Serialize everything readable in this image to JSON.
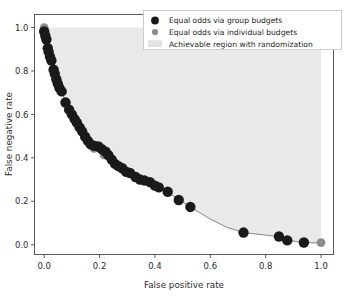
{
  "chart_data": {
    "type": "scatter",
    "title": "",
    "xlabel": "False positive rate",
    "ylabel": "False negative rate",
    "xlim": [
      -0.035,
      1.045
    ],
    "ylim": [
      -0.045,
      1.06
    ],
    "xticks": [
      0.0,
      0.2,
      0.4,
      0.6,
      0.8,
      1.0
    ],
    "yticks": [
      0.0,
      0.2,
      0.4,
      0.6,
      0.8,
      1.0
    ],
    "xticklabels": [
      "0.0",
      "0.2",
      "0.4",
      "0.6",
      "0.8",
      "1.0"
    ],
    "yticklabels": [
      "0.0",
      "0.2",
      "0.4",
      "0.6",
      "0.8",
      "1.0"
    ],
    "grid": false,
    "legend_position": "upper right",
    "series": [
      {
        "name": "Equal odds via group budgets",
        "type": "scatter",
        "color": "#1a1a1a",
        "marker": "circle",
        "marker_size": 5.2,
        "points": [
          [
            0.0,
            0.982
          ],
          [
            0.004,
            0.962
          ],
          [
            0.008,
            0.945
          ],
          [
            0.013,
            0.905
          ],
          [
            0.016,
            0.888
          ],
          [
            0.021,
            0.866
          ],
          [
            0.026,
            0.848
          ],
          [
            0.034,
            0.806
          ],
          [
            0.038,
            0.788
          ],
          [
            0.044,
            0.762
          ],
          [
            0.049,
            0.742
          ],
          [
            0.055,
            0.722
          ],
          [
            0.063,
            0.706
          ],
          [
            0.077,
            0.655
          ],
          [
            0.09,
            0.622
          ],
          [
            0.1,
            0.6
          ],
          [
            0.11,
            0.578
          ],
          [
            0.118,
            0.562
          ],
          [
            0.128,
            0.54
          ],
          [
            0.137,
            0.522
          ],
          [
            0.148,
            0.497
          ],
          [
            0.158,
            0.478
          ],
          [
            0.168,
            0.462
          ],
          [
            0.182,
            0.455
          ],
          [
            0.196,
            0.452
          ],
          [
            0.208,
            0.44
          ],
          [
            0.222,
            0.428
          ],
          [
            0.232,
            0.412
          ],
          [
            0.244,
            0.392
          ],
          [
            0.256,
            0.372
          ],
          [
            0.268,
            0.362
          ],
          [
            0.282,
            0.352
          ],
          [
            0.296,
            0.336
          ],
          [
            0.31,
            0.33
          ],
          [
            0.33,
            0.312
          ],
          [
            0.346,
            0.3
          ],
          [
            0.362,
            0.296
          ],
          [
            0.382,
            0.288
          ],
          [
            0.4,
            0.272
          ],
          [
            0.414,
            0.264
          ],
          [
            0.446,
            0.244
          ],
          [
            0.486,
            0.206
          ],
          [
            0.528,
            0.174
          ],
          [
            0.72,
            0.056
          ],
          [
            0.848,
            0.038
          ],
          [
            0.878,
            0.02
          ],
          [
            0.938,
            0.01
          ]
        ]
      },
      {
        "name": "Equal odds via individual budgets",
        "type": "scatter",
        "color": "#8c8c8c",
        "marker": "circle",
        "marker_size": 4.4,
        "points": [
          [
            0.0,
            1.0
          ],
          [
            0.18,
            0.444
          ],
          [
            0.216,
            0.414
          ],
          [
            0.25,
            0.382
          ],
          [
            1.0,
            0.01
          ]
        ]
      }
    ],
    "frontier_line": {
      "name": "tradeoff frontier",
      "color": "#6a6a6a",
      "width": 0.8,
      "points": [
        [
          0.0,
          1.0
        ],
        [
          0.01,
          0.94
        ],
        [
          0.02,
          0.878
        ],
        [
          0.035,
          0.805
        ],
        [
          0.05,
          0.742
        ],
        [
          0.065,
          0.7
        ],
        [
          0.08,
          0.648
        ],
        [
          0.095,
          0.612
        ],
        [
          0.112,
          0.574
        ],
        [
          0.13,
          0.536
        ],
        [
          0.15,
          0.494
        ],
        [
          0.17,
          0.464
        ],
        [
          0.19,
          0.454
        ],
        [
          0.21,
          0.44
        ],
        [
          0.23,
          0.418
        ],
        [
          0.25,
          0.382
        ],
        [
          0.27,
          0.362
        ],
        [
          0.29,
          0.344
        ],
        [
          0.32,
          0.32
        ],
        [
          0.35,
          0.3
        ],
        [
          0.38,
          0.29
        ],
        [
          0.41,
          0.268
        ],
        [
          0.45,
          0.24
        ],
        [
          0.49,
          0.204
        ],
        [
          0.53,
          0.172
        ],
        [
          0.6,
          0.118
        ],
        [
          0.66,
          0.08
        ],
        [
          0.72,
          0.056
        ],
        [
          0.8,
          0.044
        ],
        [
          0.85,
          0.036
        ],
        [
          0.88,
          0.02
        ],
        [
          0.94,
          0.01
        ],
        [
          1.0,
          0.008
        ]
      ]
    },
    "shaded_region": {
      "name": "Achievable region with randomization",
      "color": "#e9e9e9",
      "description": "Region above and to the right of the tradeoff frontier, bounded above by FNR = 1.0 and right by FPR = 1.0"
    },
    "annotations": []
  },
  "legend": {
    "entries": [
      {
        "label": "Equal odds via group budgets",
        "marker": "filled-circle",
        "color": "#1a1a1a"
      },
      {
        "label": "Equal odds via individual budgets",
        "marker": "filled-circle",
        "color": "#8c8c8c"
      },
      {
        "label": "Achievable region with randomization",
        "marker": "filled-patch",
        "color": "#e2e2e2"
      }
    ],
    "border_color": "#cccccc",
    "background": "#ffffff"
  },
  "axes": {
    "x_title": "False positive rate",
    "y_title": "False negative rate",
    "spine_color": "#5a5a5a"
  }
}
